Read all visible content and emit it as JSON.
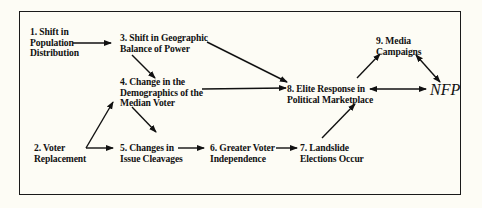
{
  "diagram": {
    "nodes": [
      {
        "id": "1",
        "lines": [
          "1. Shift in",
          "Population",
          "Distribution"
        ]
      },
      {
        "id": "2",
        "lines": [
          "2. Voter",
          "Replacement"
        ]
      },
      {
        "id": "3",
        "lines": [
          "3. Shift in Geographic",
          "Balance of Power"
        ]
      },
      {
        "id": "4",
        "lines": [
          "4. Change in the",
          "Demographics of the",
          "Median Voter"
        ]
      },
      {
        "id": "5",
        "lines": [
          "5. Changes in",
          "Issue Cleavages"
        ]
      },
      {
        "id": "6",
        "lines": [
          "6. Greater Voter",
          "Independence"
        ]
      },
      {
        "id": "7",
        "lines": [
          "7. Landslide",
          "Elections Occur"
        ]
      },
      {
        "id": "8",
        "lines": [
          "8. Elite Response in",
          "Political Marketplace"
        ]
      },
      {
        "id": "9",
        "lines": [
          "9. Media",
          "Campaigns"
        ]
      },
      {
        "id": "NFP",
        "lines": [
          "NFP"
        ]
      }
    ],
    "edges": [
      {
        "from": "1",
        "to": "3",
        "type": "directed"
      },
      {
        "from": "3",
        "to": "4",
        "type": "directed"
      },
      {
        "from": "3",
        "to": "8",
        "type": "directed"
      },
      {
        "from": "4",
        "to": "8",
        "type": "directed"
      },
      {
        "from": "4",
        "to": "5",
        "type": "directed"
      },
      {
        "from": "2",
        "to": "4",
        "type": "directed"
      },
      {
        "from": "2",
        "to": "5",
        "type": "directed"
      },
      {
        "from": "5",
        "to": "6",
        "type": "directed"
      },
      {
        "from": "6",
        "to": "7",
        "type": "directed"
      },
      {
        "from": "7",
        "to": "8",
        "type": "directed"
      },
      {
        "from": "8",
        "to": "9",
        "type": "directed"
      },
      {
        "from": "9",
        "to": "NFP",
        "type": "bidirectional"
      },
      {
        "from": "8",
        "to": "NFP",
        "type": "bidirectional"
      }
    ],
    "colors": {
      "background": "#fdfcf5",
      "ink": "#111111"
    }
  }
}
